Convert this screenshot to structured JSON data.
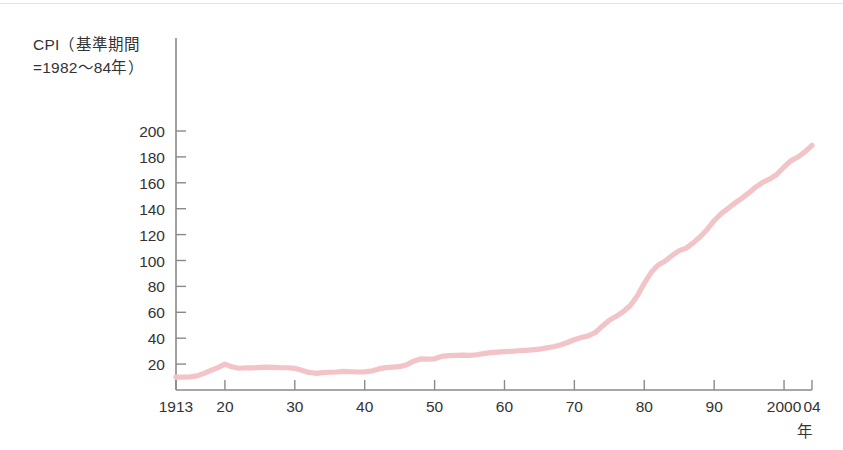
{
  "figure": {
    "y_axis_caption_line1": "CPI（基準期間",
    "y_axis_caption_line2": "=1982〜84年）",
    "x_unit_label": "年",
    "line_color": "#f2c3c7",
    "axis_color": "#8a8a8a",
    "text_color": "#333333"
  },
  "chart_data": {
    "type": "line",
    "title": "",
    "subtitle": "",
    "xlabel": "年",
    "ylabel": "CPI（基準期間=1982〜84年）",
    "grid": false,
    "legend": null,
    "xlim": [
      1913,
      2004
    ],
    "ylim": [
      0,
      210
    ],
    "ytick_labels": [
      "20",
      "40",
      "60",
      "80",
      "100",
      "120",
      "140",
      "160",
      "180",
      "200"
    ],
    "ytick_values": [
      20,
      40,
      60,
      80,
      100,
      120,
      140,
      160,
      180,
      200
    ],
    "xtick_labels": [
      "1913",
      "20",
      "30",
      "40",
      "50",
      "60",
      "70",
      "80",
      "90",
      "2000",
      "04"
    ],
    "xtick_values": [
      1913,
      1920,
      1930,
      1940,
      1950,
      1960,
      1970,
      1980,
      1990,
      2000,
      2004
    ],
    "series": [
      {
        "name": "CPI",
        "color": "#f2c3c7",
        "x": [
          1913,
          1914,
          1915,
          1916,
          1917,
          1918,
          1919,
          1920,
          1921,
          1922,
          1923,
          1924,
          1925,
          1926,
          1927,
          1928,
          1929,
          1930,
          1931,
          1932,
          1933,
          1934,
          1935,
          1936,
          1937,
          1938,
          1939,
          1940,
          1941,
          1942,
          1943,
          1944,
          1945,
          1946,
          1947,
          1948,
          1949,
          1950,
          1951,
          1952,
          1953,
          1954,
          1955,
          1956,
          1957,
          1958,
          1959,
          1960,
          1961,
          1962,
          1963,
          1964,
          1965,
          1966,
          1967,
          1968,
          1969,
          1970,
          1971,
          1972,
          1973,
          1974,
          1975,
          1976,
          1977,
          1978,
          1979,
          1980,
          1981,
          1982,
          1983,
          1984,
          1985,
          1986,
          1987,
          1988,
          1989,
          1990,
          1991,
          1992,
          1993,
          1994,
          1995,
          1996,
          1997,
          1998,
          1999,
          2000,
          2001,
          2002,
          2003,
          2004
        ],
        "y": [
          9.9,
          10.0,
          10.1,
          10.9,
          12.8,
          15.1,
          17.3,
          20.0,
          17.9,
          16.8,
          17.1,
          17.1,
          17.5,
          17.7,
          17.4,
          17.2,
          17.2,
          16.7,
          15.2,
          13.6,
          12.9,
          13.4,
          13.7,
          13.9,
          14.4,
          14.1,
          13.9,
          14.0,
          14.7,
          16.3,
          17.3,
          17.6,
          18.0,
          19.5,
          22.3,
          24.0,
          23.8,
          24.1,
          26.0,
          26.6,
          26.8,
          26.9,
          26.8,
          27.2,
          28.1,
          28.9,
          29.2,
          29.6,
          29.9,
          30.3,
          30.6,
          31.0,
          31.5,
          32.5,
          33.4,
          34.8,
          36.7,
          38.8,
          40.5,
          41.8,
          44.4,
          49.3,
          53.8,
          56.9,
          60.6,
          65.2,
          72.6,
          82.4,
          90.9,
          96.5,
          99.6,
          103.9,
          107.6,
          109.6,
          113.6,
          118.3,
          124.0,
          130.7,
          136.2,
          140.3,
          144.5,
          148.2,
          152.4,
          156.9,
          160.5,
          163.0,
          166.6,
          172.2,
          177.1,
          179.9,
          184.0,
          188.9
        ]
      }
    ],
    "annotations": []
  }
}
